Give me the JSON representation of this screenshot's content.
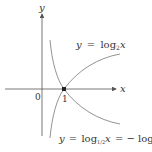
{
  "diagram": {
    "axes": {
      "x_label": "x",
      "y_label": "y",
      "origin_label": "0",
      "tick_label": "1"
    },
    "curves": [
      {
        "name": "log2",
        "label_lhs": "y",
        "label_eq": "=",
        "label_fn": "log",
        "label_base": "2",
        "label_var": "x"
      },
      {
        "name": "log_half",
        "label_lhs": "y",
        "label_eq": "=",
        "label_fn": "log",
        "label_base": "1/2",
        "label_var": "x",
        "label_rhs": "= − log",
        "label_rhs_base": "2",
        "label_rhs_var": "x"
      }
    ],
    "point": {
      "x": 1,
      "y": 0
    },
    "colors": {
      "axis": "#555555",
      "curve": "#777777",
      "point": "#222222"
    }
  }
}
